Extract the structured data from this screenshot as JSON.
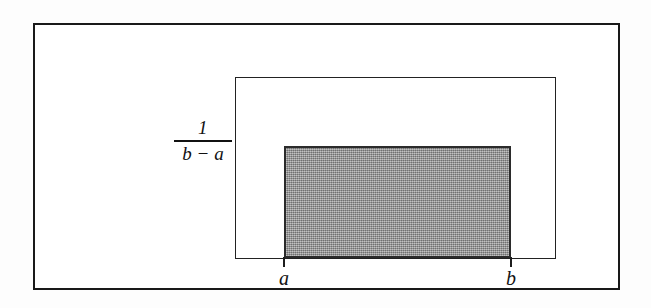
{
  "figure": {
    "height_label": {
      "numerator": "1",
      "denominator": "b − a"
    },
    "axis_labels": {
      "a": "a",
      "b": "b"
    },
    "colors": {
      "frame_border": "#191919",
      "plot_border": "#222222",
      "density_fill": "#9c9c9c",
      "density_border": "#2b2b2b",
      "background": "#fdfdfd",
      "text": "#121212"
    }
  },
  "chart_data": {
    "type": "area",
    "title": "",
    "xlabel": "",
    "ylabel": "",
    "x": [
      "a",
      "b"
    ],
    "values": [
      1,
      1
    ],
    "series": [
      {
        "name": "f(x) = 1/(b − a)",
        "values": [
          1,
          1
        ]
      }
    ],
    "tick_labels": {
      "x": [
        "a",
        "b"
      ],
      "y": [
        "1/(b − a)"
      ]
    },
    "annotations": [
      {
        "text": "1/(b − a)",
        "role": "density-height",
        "position": "left-axis"
      },
      {
        "text": "a",
        "role": "x-tick",
        "position": "left-edge-of-support"
      },
      {
        "text": "b",
        "role": "x-tick",
        "position": "right-edge-of-support"
      }
    ],
    "grid": false,
    "legend": false,
    "shaded_region": {
      "from": "a",
      "to": "b",
      "height": "1/(b − a)",
      "fill": "#9c9c9c"
    }
  }
}
